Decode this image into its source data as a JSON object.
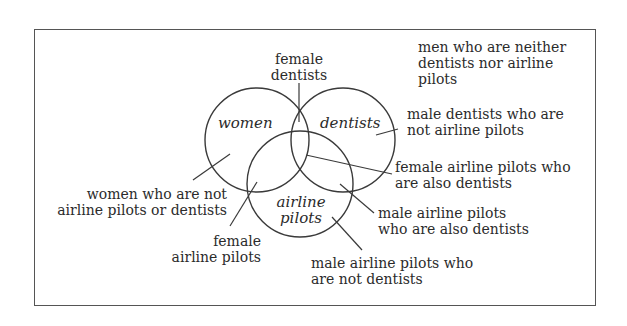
{
  "diagram": {
    "type": "venn",
    "sets": [
      {
        "id": "women",
        "label": "women"
      },
      {
        "id": "dentists",
        "label": "dentists"
      },
      {
        "id": "airline_pilots",
        "label_line1": "airline",
        "label_line2": "pilots"
      }
    ],
    "regions": {
      "female_dentists": {
        "line1": "female",
        "line2": "dentists"
      },
      "men_neither": {
        "line1": "men who are neither",
        "line2": "dentists nor airline",
        "line3": "pilots"
      },
      "male_dentists_not_pilots": {
        "line1": "male dentists who are",
        "line2": "not airline pilots"
      },
      "female_pilots_also_dentists": {
        "line1": "female airline pilots who",
        "line2": "are also dentists"
      },
      "women_not_pilots_or_dentists": {
        "line1": "women who are not",
        "line2": "airline pilots or dentists"
      },
      "male_pilots_also_dentists": {
        "line1": "male airline pilots",
        "line2": "who are also dentists"
      },
      "female_airline_pilots": {
        "line1": "female",
        "line2": "airline pilots"
      },
      "male_pilots_not_dentists": {
        "line1": "male airline pilots who",
        "line2": "are not dentists"
      }
    },
    "colors": {
      "stroke": "#3a3a3a",
      "frame": "#555555",
      "background": "#ffffff",
      "text": "#2b2b2b"
    }
  }
}
